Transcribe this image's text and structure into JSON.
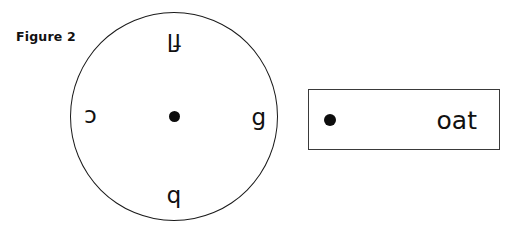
{
  "figure": {
    "label": "Figure 2"
  },
  "circle": {
    "center_marker": "dot-marker",
    "letters": {
      "top": "fl",
      "bottom": "b",
      "left": "c",
      "right": "g"
    },
    "orientations": {
      "top": "rotated-180",
      "bottom": "rotated-180",
      "left": "rotated-180",
      "right": "upright"
    }
  },
  "rectangle": {
    "marker": "dot-marker",
    "word": "oat"
  },
  "colors": {
    "stroke": "#1a1a1a",
    "rect_stroke": "#3a3a3a",
    "marker": "#0d0d0d",
    "text": "#111111",
    "background": "#ffffff"
  }
}
